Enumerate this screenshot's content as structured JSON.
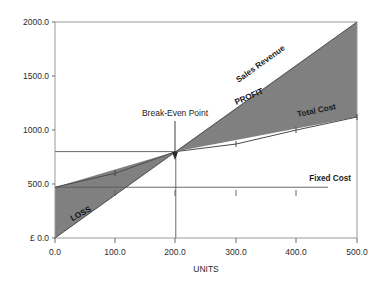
{
  "chart_data": {
    "type": "line",
    "title": "",
    "xlabel": "UNITS",
    "ylabel": "",
    "currency_symbol": "£",
    "xlim": [
      0,
      500
    ],
    "ylim": [
      0,
      2000
    ],
    "grid": false,
    "legend_position": "inline-on-lines",
    "x_ticks": [
      "0.0",
      "100.0",
      "200.0",
      "300.0",
      "400.0",
      "500.0"
    ],
    "x_tick_values": [
      0,
      100,
      200,
      300,
      400,
      500
    ],
    "y_ticks": [
      "£ 0.0",
      "500.0",
      "1000.0",
      "1500.0",
      "2000.0"
    ],
    "y_tick_values": [
      0,
      500,
      1000,
      1500,
      2000
    ],
    "series": [
      {
        "name": "Sales Revenue",
        "label": "Sales Revenue",
        "x": [
          0,
          500
        ],
        "values": [
          0,
          2000
        ],
        "slope_per_unit": 4.0,
        "intercept": 0
      },
      {
        "name": "Total Cost",
        "label": "Total Cost",
        "x": [
          0,
          100,
          200,
          300,
          400,
          500
        ],
        "values": [
          470,
          600,
          800,
          870,
          1000,
          1120
        ],
        "intercept": 470
      },
      {
        "name": "Fixed Cost",
        "label": "Fixed Cost",
        "x": [
          0,
          500
        ],
        "values": [
          470,
          470
        ],
        "constant": 470
      }
    ],
    "regions": [
      {
        "name": "LOSS",
        "label": "LOSS",
        "x_range": [
          0,
          200
        ],
        "fill": "#808080"
      },
      {
        "name": "PROFIT",
        "label": "PROFIT",
        "x_range": [
          200,
          500
        ],
        "fill": "#808080"
      }
    ],
    "annotations": [
      {
        "name": "break-even-point",
        "label": "Break-Even Point",
        "x": 200,
        "y": 800,
        "marker": "down-arrow"
      }
    ]
  },
  "colors": {
    "fill_gray": "#808080",
    "line": "#4a4a4a",
    "frame": "#9a9a9a",
    "text": "#1c1c1c"
  }
}
